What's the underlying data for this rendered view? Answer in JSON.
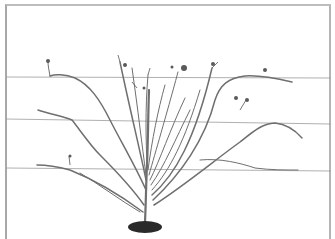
{
  "illustration": {
    "subject": "fan-trained shrub on horizontal support wires",
    "wire_count": 3,
    "colors": {
      "background": "#ffffff",
      "frame": "#a8a8a8",
      "wire": "#9c9c9c",
      "stem": "#6f6f6f",
      "soil": "#2a2a2a"
    }
  }
}
